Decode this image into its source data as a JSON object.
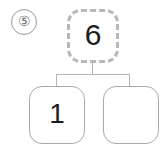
{
  "worksheet": {
    "item_label": "⑤",
    "item_number": "5",
    "type": "number-bond"
  },
  "number_bond": {
    "whole": {
      "label": "whole",
      "value": "6",
      "filled": true,
      "border_color": "#b8b8b8",
      "border_style": "dashed"
    },
    "parts": [
      {
        "label": "part-left",
        "value": "1",
        "filled": true,
        "border_color": "#a9a9a9",
        "border_style": "solid"
      },
      {
        "label": "part-right",
        "value": "",
        "filled": false,
        "border_color": "#a9a9a9",
        "border_style": "solid"
      }
    ],
    "connector_color": "#b3b3b3"
  },
  "colors": {
    "background": "#ffffff",
    "ink": "#1d1d1d",
    "outline_light": "#a9a9a9",
    "outline_emphasis": "#b8b8b8",
    "number_circle": "#9a9a9a"
  }
}
